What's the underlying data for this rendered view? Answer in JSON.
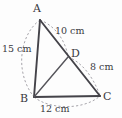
{
  "figure": {
    "background_color": "#fdfdfd",
    "line_color": "#444349",
    "arc_color": "#9c9aa0",
    "text_color": "#3a393e",
    "unit": "cm",
    "vertices": [
      {
        "id": "A",
        "label": "A",
        "x": 40,
        "y": 20
      },
      {
        "id": "B",
        "label": "B",
        "x": 34,
        "y": 97
      },
      {
        "id": "C",
        "label": "C",
        "x": 100,
        "y": 96
      },
      {
        "id": "D",
        "label": "D",
        "x": 68,
        "y": 57
      }
    ],
    "edges": [
      {
        "id": "AB",
        "from": "A",
        "to": "B",
        "style": "solid"
      },
      {
        "id": "AC",
        "from": "A",
        "to": "C",
        "style": "solid",
        "note": "passes through D"
      },
      {
        "id": "BC",
        "from": "B",
        "to": "C",
        "style": "solid"
      },
      {
        "id": "BD",
        "from": "B",
        "to": "D",
        "style": "solid"
      }
    ],
    "measurements": [
      {
        "id": "AB",
        "segment": "AB",
        "value": 15,
        "unit": "cm",
        "label": "15 cm",
        "side": "left"
      },
      {
        "id": "AD",
        "segment": "AD",
        "value": 10,
        "unit": "cm",
        "label": "10 cm",
        "side": "upper-right"
      },
      {
        "id": "DC",
        "segment": "DC",
        "value": 8,
        "unit": "cm",
        "label": "8 cm",
        "side": "lower-right"
      },
      {
        "id": "BC",
        "segment": "BC",
        "value": 12,
        "unit": "cm",
        "label": "12 cm",
        "side": "bottom"
      }
    ],
    "arcs": [
      {
        "id": "arc-AB",
        "for": "AB",
        "style": "dashed"
      },
      {
        "id": "arc-AD",
        "for": "AD",
        "style": "dashed"
      },
      {
        "id": "arc-DC",
        "for": "DC",
        "style": "dashed"
      },
      {
        "id": "arc-BC",
        "for": "BC",
        "style": "dashed"
      }
    ]
  }
}
